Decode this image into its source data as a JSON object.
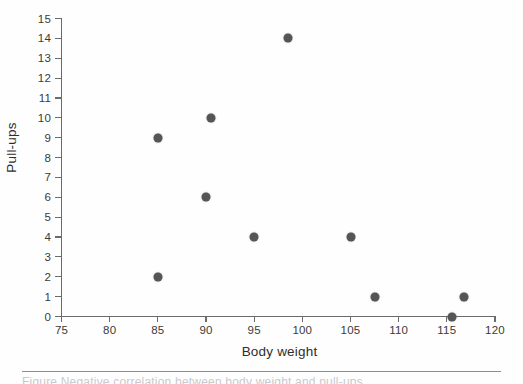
{
  "chart_data": {
    "type": "scatter",
    "title": "",
    "xlabel": "Body weight",
    "ylabel": "Pull-ups",
    "xlim": [
      75,
      120
    ],
    "ylim": [
      0,
      15
    ],
    "xticks": [
      75,
      80,
      85,
      90,
      95,
      100,
      105,
      110,
      115,
      120
    ],
    "yticks": [
      0,
      1,
      2,
      3,
      4,
      5,
      6,
      7,
      8,
      9,
      10,
      11,
      12,
      13,
      14,
      15
    ],
    "grid": false,
    "legend": null,
    "marker_color": "#555558",
    "axis_color": "#6b6b6b",
    "points": [
      {
        "x": 85.0,
        "y": 9
      },
      {
        "x": 85.0,
        "y": 2
      },
      {
        "x": 90.5,
        "y": 10
      },
      {
        "x": 90.0,
        "y": 6
      },
      {
        "x": 95.0,
        "y": 4
      },
      {
        "x": 98.5,
        "y": 14
      },
      {
        "x": 105.0,
        "y": 4
      },
      {
        "x": 107.5,
        "y": 1
      },
      {
        "x": 115.5,
        "y": 0
      },
      {
        "x": 116.8,
        "y": 1
      }
    ]
  },
  "caption": {
    "text": "Figure  Negative correlation between body weight and pull-ups"
  }
}
